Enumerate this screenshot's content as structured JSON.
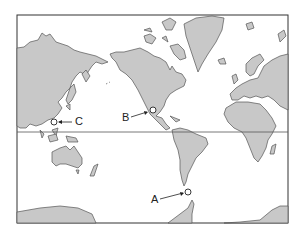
{
  "map": {
    "type": "world-map-mercator",
    "colors": {
      "land": "#c8c8c8",
      "ocean": "#ffffff",
      "outline": "#555555",
      "frame": "#333333",
      "equator": "#555555"
    },
    "equator_line": true,
    "points": [
      {
        "id": "A",
        "label": "A",
        "location": "south of South America (Drake Passage)"
      },
      {
        "id": "B",
        "label": "B",
        "location": "west coast of Mexico"
      },
      {
        "id": "C",
        "label": "C",
        "location": "Southeast Asia, near Philippines / South China Sea"
      }
    ]
  }
}
